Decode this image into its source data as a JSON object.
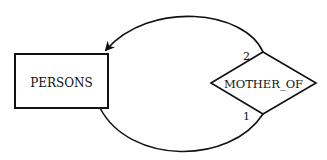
{
  "diagram": {
    "type": "entity-relationship",
    "entity": {
      "label": "PERSONS"
    },
    "relationship": {
      "label": "MOTHER_OF"
    },
    "roles": [
      {
        "label": "2",
        "position": "upper"
      },
      {
        "label": "1",
        "position": "lower"
      }
    ],
    "colors": {
      "stroke": "#111111",
      "background": "#ffffff"
    }
  }
}
